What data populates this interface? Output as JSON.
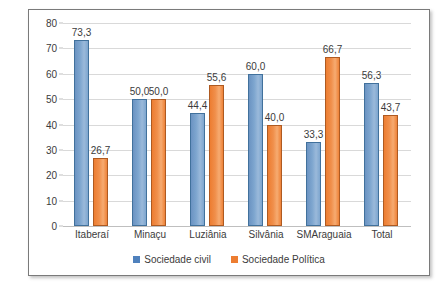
{
  "chart_data": {
    "type": "bar",
    "title": "",
    "xlabel": "",
    "ylabel": "",
    "ylim": [
      0,
      80
    ],
    "ytick_step": 10,
    "yticks": [
      "80",
      "70",
      "60",
      "50",
      "40",
      "30",
      "20",
      "10",
      "0"
    ],
    "grid": true,
    "legend_position": "bottom",
    "decimal_separator": ",",
    "categories": [
      "Itaberaí",
      "Minaçu",
      "Luziânia",
      "Silvânia",
      "SMAraguaia",
      "Total"
    ],
    "series": [
      {
        "name": "Sociedade civil",
        "color": "#4f81bd",
        "values": [
          73.3,
          50.0,
          44.4,
          60.0,
          33.3,
          56.3
        ],
        "labels": [
          "73,3",
          "50,0",
          "44,4",
          "60,0",
          "33,3",
          "56,3"
        ]
      },
      {
        "name": "Sociedade Política",
        "color": "#ed7d31",
        "values": [
          26.7,
          50.0,
          55.6,
          40.0,
          66.7,
          43.7
        ],
        "labels": [
          "26,7",
          "50,0",
          "55,6",
          "40,0",
          "66,7",
          "43,7"
        ]
      }
    ]
  },
  "legend": {
    "items": [
      {
        "label": "Sociedade civil",
        "color": "#4f81bd"
      },
      {
        "label": "Sociedade Política",
        "color": "#ed7d31"
      }
    ]
  },
  "colors": {
    "series_civil": "#4f81bd",
    "series_politica": "#ed7d31",
    "gridline": "#d9d9d9",
    "frame_border": "#7a7a7a",
    "text": "#3b3b3b",
    "background": "#ffffff"
  }
}
